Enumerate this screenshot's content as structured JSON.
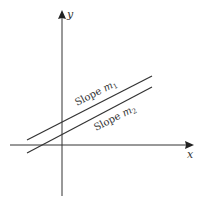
{
  "diagram": {
    "type": "coordinate-plane-parallel-lines",
    "axes": {
      "x_label": "x",
      "y_label": "y"
    },
    "lines": [
      {
        "label_prefix": "Slope ",
        "label_var": "m",
        "label_sub": "1"
      },
      {
        "label_prefix": "Slope ",
        "label_var": "m",
        "label_sub": "2"
      }
    ],
    "colors": {
      "stroke": "#333333",
      "background": "#ffffff"
    }
  }
}
